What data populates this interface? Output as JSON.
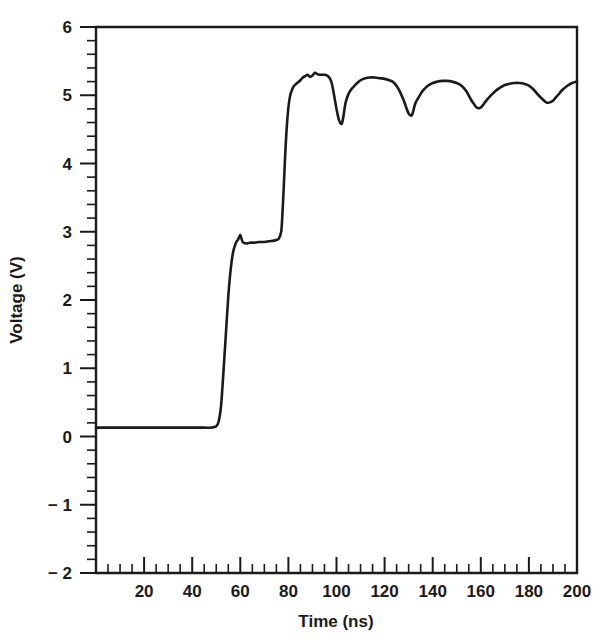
{
  "chart_data": {
    "type": "line",
    "title": "",
    "xlabel": "Time (ns)",
    "ylabel": "Voltage (V)",
    "xlim": [
      0,
      200
    ],
    "ylim": [
      -2,
      6
    ],
    "grid": false,
    "legend": null,
    "x_ticks": [
      20,
      40,
      60,
      80,
      100,
      120,
      140,
      160,
      180,
      200
    ],
    "x_tick_labels": [
      "20",
      "40",
      "60",
      "80",
      "100",
      "120",
      "140",
      "160",
      "180",
      "200"
    ],
    "x_minor_tick_interval": 5,
    "y_ticks": [
      -2,
      -1,
      0,
      1,
      2,
      3,
      4,
      5,
      6
    ],
    "y_tick_labels": [
      "− 2",
      "− 1",
      "0",
      "1",
      "2",
      "3",
      "4",
      "5",
      "6"
    ],
    "y_minor_tick_interval": 0.2,
    "line_color": "#1a1a1a",
    "background_color": "#ffffff",
    "series": [
      {
        "name": "Voltage",
        "x": [
          0,
          5,
          10,
          15,
          20,
          25,
          30,
          35,
          40,
          45,
          48,
          50,
          51,
          52,
          53,
          54,
          55,
          56,
          57,
          58,
          58.5,
          59,
          59.5,
          60,
          60.5,
          61,
          62,
          63,
          64,
          66,
          68,
          70,
          72,
          74,
          75,
          76,
          77,
          77.5,
          78,
          78.5,
          79,
          79.5,
          80,
          80.5,
          81,
          82,
          83,
          84,
          85,
          86,
          87,
          88,
          89,
          90,
          91,
          92,
          93,
          94,
          95,
          96,
          97,
          98,
          99,
          100,
          101,
          102,
          102.5,
          103,
          103.5,
          104,
          105,
          106,
          107,
          108,
          110,
          112,
          114,
          116,
          118,
          120,
          122,
          124,
          126,
          128,
          129,
          130,
          131,
          131.5,
          132,
          132.5,
          133,
          134,
          135,
          136,
          138,
          140,
          142,
          144,
          146,
          148,
          150,
          152,
          154,
          156,
          157,
          158,
          159,
          160,
          161,
          162,
          164,
          166,
          168,
          170,
          172,
          174,
          176,
          178,
          180,
          182,
          184,
          186,
          187,
          188,
          189,
          190,
          191,
          192,
          194,
          196,
          198,
          200
        ],
        "y": [
          0.13,
          0.13,
          0.13,
          0.13,
          0.13,
          0.13,
          0.13,
          0.13,
          0.13,
          0.13,
          0.13,
          0.15,
          0.22,
          0.45,
          0.95,
          1.5,
          2.05,
          2.45,
          2.7,
          2.82,
          2.86,
          2.88,
          2.92,
          2.95,
          2.9,
          2.85,
          2.83,
          2.83,
          2.84,
          2.84,
          2.85,
          2.85,
          2.86,
          2.87,
          2.88,
          2.9,
          3.0,
          3.25,
          3.6,
          4.0,
          4.35,
          4.62,
          4.82,
          4.95,
          5.03,
          5.12,
          5.16,
          5.19,
          5.22,
          5.26,
          5.28,
          5.3,
          5.27,
          5.29,
          5.33,
          5.31,
          5.3,
          5.3,
          5.3,
          5.29,
          5.26,
          5.18,
          5.0,
          4.8,
          4.64,
          4.58,
          4.62,
          4.72,
          4.84,
          4.92,
          5.02,
          5.08,
          5.12,
          5.16,
          5.22,
          5.25,
          5.26,
          5.26,
          5.25,
          5.24,
          5.22,
          5.18,
          5.08,
          4.92,
          4.82,
          4.73,
          4.7,
          4.72,
          4.78,
          4.85,
          4.9,
          4.96,
          5.02,
          5.07,
          5.14,
          5.18,
          5.2,
          5.21,
          5.21,
          5.2,
          5.18,
          5.14,
          5.06,
          4.93,
          4.88,
          4.83,
          4.81,
          4.82,
          4.86,
          4.91,
          4.99,
          5.06,
          5.11,
          5.15,
          5.17,
          5.18,
          5.18,
          5.17,
          5.14,
          5.08,
          5.0,
          4.93,
          4.9,
          4.89,
          4.9,
          4.92,
          4.96,
          5.0,
          5.08,
          5.14,
          5.18,
          5.2
        ]
      }
    ]
  },
  "axes": {
    "x_title": "Time (ns)",
    "y_title": "Voltage (V)"
  }
}
